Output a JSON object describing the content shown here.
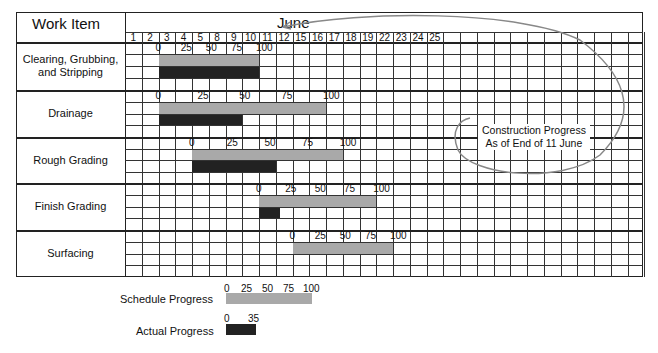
{
  "header": {
    "work_item": "Work Item",
    "month": "June"
  },
  "days": [
    "1",
    "2",
    "3",
    "4",
    "5",
    "8",
    "9",
    "10",
    "11",
    "12",
    "15",
    "16",
    "17",
    "18",
    "19",
    "22",
    "23",
    "24",
    "25"
  ],
  "annotation": {
    "line1": "Construction Progress",
    "line2": "As of End of 11 June"
  },
  "legend": {
    "schedule_label": "Schedule Progress",
    "schedule_ticks": [
      "0",
      "25",
      "50",
      "75",
      "100"
    ],
    "actual_label": "Actual Progress",
    "actual_ticks": [
      "0",
      "35"
    ],
    "colors": {
      "schedule": "#a9a9a9",
      "actual": "#222222"
    }
  },
  "tasks": [
    {
      "name": "Clearing, Grubbing, and Stripping",
      "ticks": [
        "0",
        "25",
        "50",
        "75",
        "100"
      ],
      "sched_start_col": 2,
      "sched_end_col": 8,
      "actual_end_col": 8
    },
    {
      "name": "Drainage",
      "ticks": [
        "0",
        "25",
        "50",
        "75",
        "100"
      ],
      "sched_start_col": 2,
      "sched_end_col": 12,
      "actual_end_col": 7
    },
    {
      "name": "Rough Grading",
      "ticks": [
        "0",
        "25",
        "50",
        "75",
        "100"
      ],
      "sched_start_col": 4,
      "sched_end_col": 13,
      "actual_end_col": 9
    },
    {
      "name": "Finish Grading",
      "ticks": [
        "0",
        "25",
        "50",
        "75",
        "100"
      ],
      "sched_start_col": 8,
      "sched_end_col": 15,
      "actual_end_col": 9.25
    },
    {
      "name": "Surfacing",
      "ticks": [
        "0",
        "25",
        "50",
        "75",
        "100"
      ],
      "sched_start_col": 10,
      "sched_end_col": 16,
      "actual_end_col": null
    }
  ]
}
